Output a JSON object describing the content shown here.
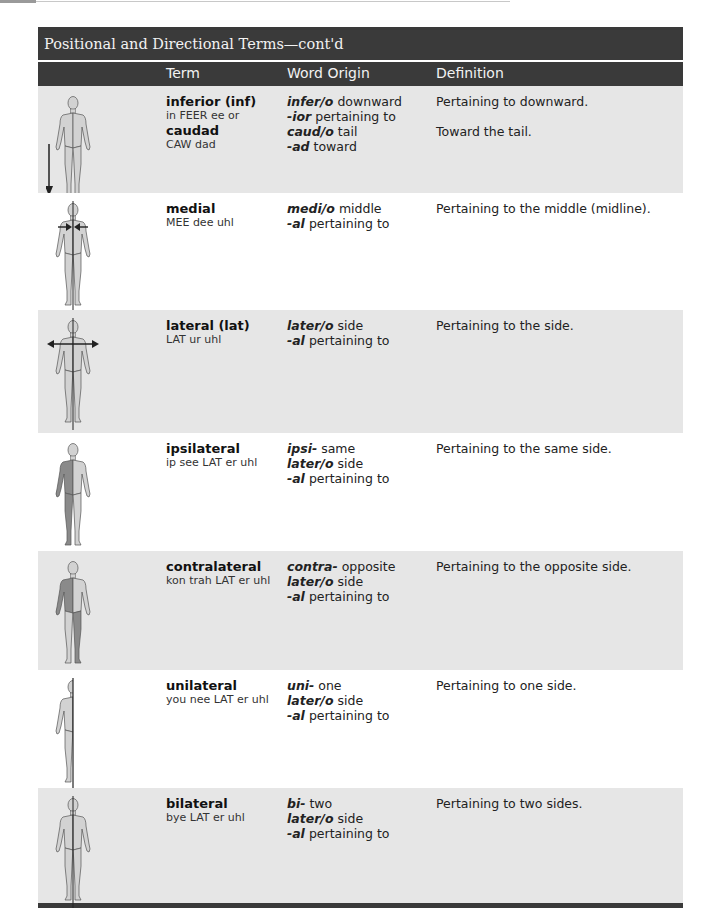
{
  "header": {
    "title": "Positional and Directional Terms—cont'd",
    "columns": [
      "Term",
      "Word Origin",
      "Definition"
    ]
  },
  "rows": [
    {
      "figure": "body-figure-arrow-down-icon",
      "terms": [
        {
          "name": "inferior (inf)",
          "pronunciation": "in FEER ee or"
        },
        {
          "name": "caudad",
          "pronunciation": "CAW dad"
        }
      ],
      "origins": [
        {
          "part": "infer/o",
          "meaning": "downward"
        },
        {
          "part": "-ior",
          "meaning": "pertaining to"
        },
        {
          "part": "caud/o",
          "meaning": "tail"
        },
        {
          "part": "-ad",
          "meaning": "toward"
        }
      ],
      "definitions": [
        "Pertaining to downward.",
        "",
        "Toward the tail."
      ]
    },
    {
      "figure": "body-figure-arrows-inward-icon",
      "terms": [
        {
          "name": "medial",
          "pronunciation": "MEE dee uhl"
        }
      ],
      "origins": [
        {
          "part": "medi/o",
          "meaning": "middle"
        },
        {
          "part": "-al",
          "meaning": "pertaining to"
        }
      ],
      "definitions": [
        "Pertaining to the middle (midline)."
      ]
    },
    {
      "figure": "body-figure-arrows-outward-icon",
      "terms": [
        {
          "name": "lateral (lat)",
          "pronunciation": "LAT ur uhl"
        }
      ],
      "origins": [
        {
          "part": "later/o",
          "meaning": "side"
        },
        {
          "part": "-al",
          "meaning": "pertaining to"
        }
      ],
      "definitions": [
        "Pertaining to the side."
      ]
    },
    {
      "figure": "body-figure-same-side-shaded-icon",
      "terms": [
        {
          "name": "ipsilateral",
          "pronunciation": "ip see LAT er uhl"
        }
      ],
      "origins": [
        {
          "part": "ipsi-",
          "meaning": "same"
        },
        {
          "part": "later/o",
          "meaning": "side"
        },
        {
          "part": "-al",
          "meaning": "pertaining to"
        }
      ],
      "definitions": [
        "Pertaining to the same side."
      ]
    },
    {
      "figure": "body-figure-opposite-side-shaded-icon",
      "terms": [
        {
          "name": "contralateral",
          "pronunciation": "kon trah LAT er uhl"
        }
      ],
      "origins": [
        {
          "part": "contra-",
          "meaning": "opposite"
        },
        {
          "part": "later/o",
          "meaning": "side"
        },
        {
          "part": "-al",
          "meaning": "pertaining to"
        }
      ],
      "definitions": [
        "Pertaining to the opposite side."
      ]
    },
    {
      "figure": "body-figure-half-icon",
      "terms": [
        {
          "name": "unilateral",
          "pronunciation": "you nee LAT er uhl"
        }
      ],
      "origins": [
        {
          "part": "uni-",
          "meaning": "one"
        },
        {
          "part": "later/o",
          "meaning": "side"
        },
        {
          "part": "-al",
          "meaning": "pertaining to"
        }
      ],
      "definitions": [
        "Pertaining to one side."
      ]
    },
    {
      "figure": "body-figure-midline-icon",
      "terms": [
        {
          "name": "bilateral",
          "pronunciation": "bye LAT er uhl"
        }
      ],
      "origins": [
        {
          "part": "bi-",
          "meaning": "two"
        },
        {
          "part": "later/o",
          "meaning": "side"
        },
        {
          "part": "-al",
          "meaning": "pertaining to"
        }
      ],
      "definitions": [
        "Pertaining to two sides."
      ]
    }
  ],
  "colors": {
    "header_bg": "#3a3a3a",
    "header_text": "#f2f2f2",
    "row_gray": "#e6e6e6",
    "row_white": "#ffffff",
    "figure_fill": "#d2d2d2",
    "figure_shade": "#8a8a8a"
  }
}
